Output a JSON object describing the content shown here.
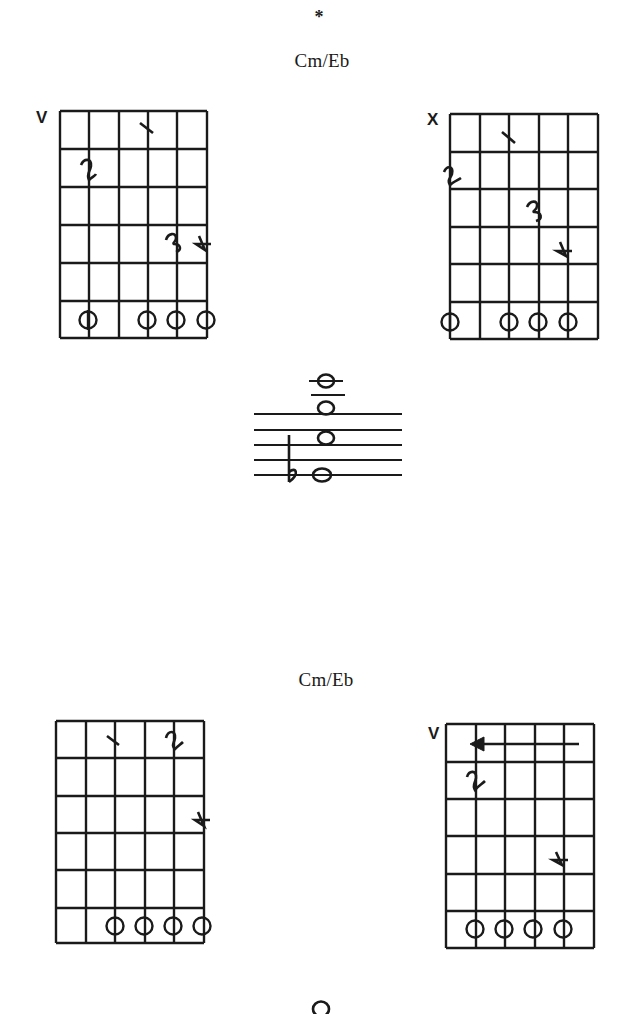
{
  "page": {
    "marker": "*",
    "sections": [
      {
        "title": "Cm/Eb",
        "diagrams": [
          {
            "position_label": "V",
            "strings": 6,
            "frets": 6,
            "fingers": [
              {
                "finger": "1",
                "string": 4,
                "fret": 1
              },
              {
                "finger": "2",
                "string": 2,
                "fret": 2
              },
              {
                "finger": "3",
                "string": 5,
                "fret": 4
              },
              {
                "finger": "4",
                "string": 6,
                "fret": 4
              }
            ],
            "open_strings": [
              2,
              4,
              5,
              6
            ]
          },
          {
            "position_label": "X",
            "strings": 6,
            "frets": 6,
            "fingers": [
              {
                "finger": "1",
                "string": 3,
                "fret": 1
              },
              {
                "finger": "2",
                "string": 1,
                "fret": 2
              },
              {
                "finger": "3",
                "string": 4,
                "fret": 3
              },
              {
                "finger": "4",
                "string": 5,
                "fret": 4
              }
            ],
            "open_strings": [
              1,
              3,
              4,
              5
            ]
          }
        ],
        "notation": {
          "accidental": "b",
          "notes": [
            "Eb",
            "C",
            "G",
            "C"
          ]
        }
      },
      {
        "title": "Cm/Eb",
        "diagrams": [
          {
            "position_label": "",
            "strings": 6,
            "frets": 6,
            "fingers": [
              {
                "finger": "1",
                "string": 3,
                "fret": 1
              },
              {
                "finger": "2",
                "string": 5,
                "fret": 1
              },
              {
                "finger": "4",
                "string": 6,
                "fret": 3
              }
            ],
            "open_strings": [
              3,
              4,
              5,
              6
            ]
          },
          {
            "position_label": "V",
            "strings": 6,
            "frets": 6,
            "slide_arrow": "left",
            "fingers": [
              {
                "finger": "2",
                "string": 2,
                "fret": 2
              },
              {
                "finger": "4",
                "string": 5,
                "fret": 4
              }
            ],
            "open_strings": [
              2,
              3,
              4,
              5
            ]
          }
        ]
      }
    ]
  }
}
